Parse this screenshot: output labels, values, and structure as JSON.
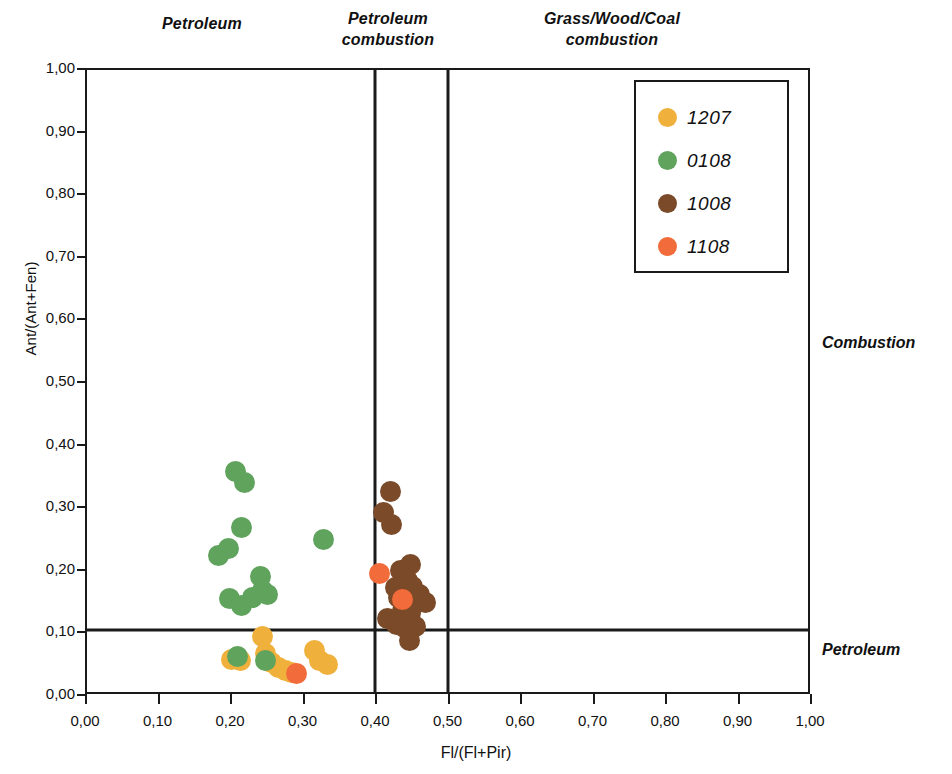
{
  "zones": {
    "top": [
      {
        "id": "petroleum",
        "label": "Petroleum"
      },
      {
        "id": "petroleum-combustion",
        "label": "Petroleum\ncombustion"
      },
      {
        "id": "grass-wood-coal-combustion",
        "label": "Grass/Wood/Coal\ncombustion"
      }
    ],
    "right": [
      {
        "id": "combustion",
        "label": "Combustion"
      },
      {
        "id": "petroleum",
        "label": "Petroleum"
      }
    ]
  },
  "legend": {
    "position": "top-right-inside",
    "entries": [
      {
        "name": "1207",
        "color": "#F0B03C"
      },
      {
        "name": "0108",
        "color": "#5FA35C"
      },
      {
        "name": "1008",
        "color": "#7B4A28"
      },
      {
        "name": "1108",
        "color": "#F26B3A"
      }
    ]
  },
  "chart_data": {
    "type": "scatter",
    "title": "",
    "xlabel": "Fl/(Fl+Pir)",
    "ylabel": "Ant/(Ant+Fen)",
    "xlim": [
      0.0,
      1.0
    ],
    "ylim": [
      0.0,
      1.0
    ],
    "grid": false,
    "x_ticks": [
      "0,00",
      "0,10",
      "0,20",
      "0,30",
      "0,40",
      "0,50",
      "0,60",
      "0,70",
      "0,80",
      "0,90",
      "1,00"
    ],
    "x_tick_values": [
      0.0,
      0.1,
      0.2,
      0.3,
      0.4,
      0.5,
      0.6,
      0.7,
      0.8,
      0.9,
      1.0
    ],
    "y_ticks": [
      "0,00",
      "0,10",
      "0,20",
      "0,30",
      "0,40",
      "0,50",
      "0,60",
      "0,70",
      "0,80",
      "0,90",
      "1,00"
    ],
    "y_tick_values": [
      0.0,
      0.1,
      0.2,
      0.3,
      0.4,
      0.5,
      0.6,
      0.7,
      0.8,
      0.9,
      1.0
    ],
    "reference_lines": {
      "vertical": [
        0.4,
        0.5
      ],
      "horizontal": [
        0.1
      ]
    },
    "series": [
      {
        "name": "1207",
        "color": "#F0B03C",
        "points": [
          [
            0.201,
            0.052
          ],
          [
            0.213,
            0.05
          ],
          [
            0.243,
            0.09
          ],
          [
            0.247,
            0.062
          ],
          [
            0.256,
            0.047
          ],
          [
            0.266,
            0.04
          ],
          [
            0.275,
            0.035
          ],
          [
            0.284,
            0.032
          ],
          [
            0.316,
            0.066
          ],
          [
            0.323,
            0.05
          ],
          [
            0.333,
            0.044
          ]
        ]
      },
      {
        "name": "0108",
        "color": "#5FA35C",
        "points": [
          [
            0.206,
            0.355
          ],
          [
            0.219,
            0.337
          ],
          [
            0.183,
            0.22
          ],
          [
            0.196,
            0.231
          ],
          [
            0.214,
            0.265
          ],
          [
            0.328,
            0.245
          ],
          [
            0.198,
            0.151
          ],
          [
            0.214,
            0.139
          ],
          [
            0.229,
            0.152
          ],
          [
            0.24,
            0.185
          ],
          [
            0.243,
            0.163
          ],
          [
            0.251,
            0.157
          ],
          [
            0.209,
            0.057
          ],
          [
            0.247,
            0.051
          ]
        ]
      },
      {
        "name": "1008",
        "color": "#7B4A28",
        "points": [
          [
            0.421,
            0.322
          ],
          [
            0.411,
            0.289
          ],
          [
            0.423,
            0.27
          ],
          [
            0.435,
            0.196
          ],
          [
            0.449,
            0.205
          ],
          [
            0.444,
            0.18
          ],
          [
            0.428,
            0.168
          ],
          [
            0.452,
            0.17
          ],
          [
            0.461,
            0.156
          ],
          [
            0.432,
            0.152
          ],
          [
            0.455,
            0.143
          ],
          [
            0.469,
            0.144
          ],
          [
            0.438,
            0.131
          ],
          [
            0.449,
            0.126
          ],
          [
            0.417,
            0.118
          ],
          [
            0.429,
            0.108
          ],
          [
            0.441,
            0.104
          ],
          [
            0.455,
            0.106
          ],
          [
            0.447,
            0.083
          ]
        ]
      },
      {
        "name": "1108",
        "color": "#F26B3A",
        "points": [
          [
            0.405,
            0.191
          ],
          [
            0.437,
            0.148
          ],
          [
            0.29,
            0.029
          ]
        ]
      }
    ]
  }
}
